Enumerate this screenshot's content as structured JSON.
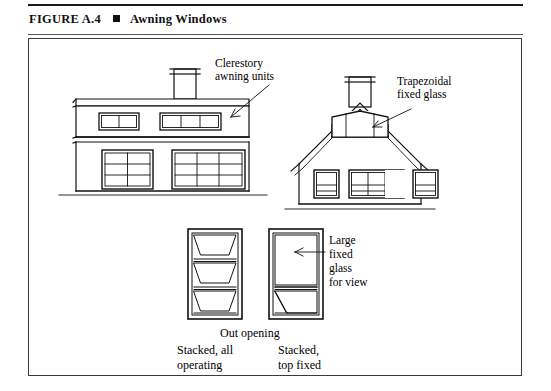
{
  "caption": {
    "figure_label": "FIGURE A.4",
    "bullet": "square-marker",
    "title": "Awning Windows"
  },
  "figure": {
    "labels": {
      "clerestory": "Clerestory\nawning units",
      "trapezoidal": "Trapezoidal\nfixed glass",
      "large_fixed": "Large\nfixed\nglass\nfor view",
      "out_opening": "Out opening",
      "stacked_all_operating": "Stacked, all\noperating",
      "stacked_top_fixed": "Stacked,\ntop fixed"
    },
    "drawings": [
      {
        "name": "flat-roof-house-elevation",
        "description": "Left elevation of a flat roof house with a chimney, a clerestory band containing a 2-pane awning group and a 3-pane awning group, and two large lower window groups.",
        "clerestory_groups": [
          2,
          3
        ],
        "lower_window_groups": [
          2,
          3
        ]
      },
      {
        "name": "gable-roof-house-elevation",
        "description": "Right elevation of a gable roof house with a chimney, a trapezoidal fixed glass unit in the gable, and three lower window groups.",
        "gable_glass_panes": 3,
        "lower_window_groups": [
          1,
          3,
          1
        ]
      },
      {
        "name": "stacked-all-operating-unit",
        "description": "Detail of a stacked awning window with three operating out-opening sashes.",
        "sashes": 3,
        "operating_sashes": 3
      },
      {
        "name": "stacked-top-fixed-unit",
        "description": "Detail of a stacked awning window with a large fixed top light for view and one operating awning sash at the bottom.",
        "sashes": 2,
        "operating_sashes": 1,
        "fixed_sashes": 1
      }
    ],
    "colors": {
      "ink": "#000000",
      "rule": "#1a1a1a",
      "frame": "#3a3a3a",
      "paper": "#ffffff"
    }
  }
}
